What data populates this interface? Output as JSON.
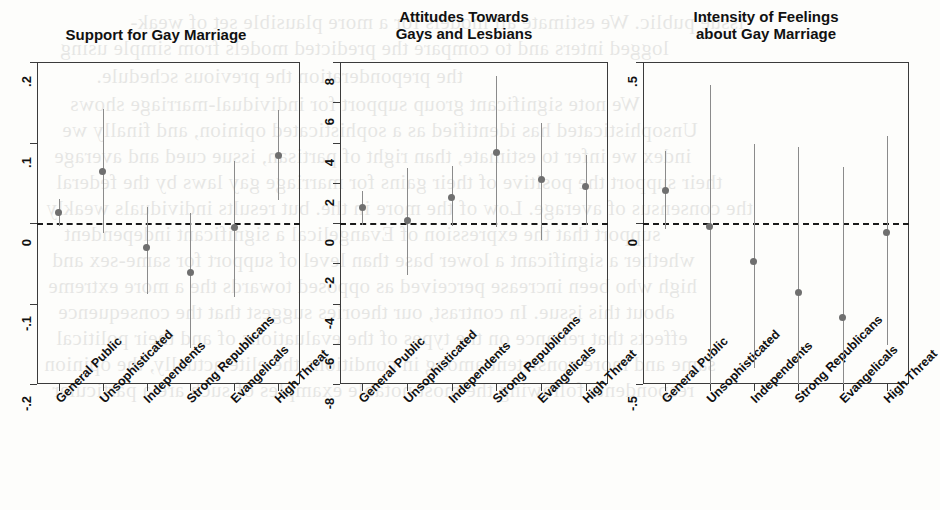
{
  "figure": {
    "background_color": "#fdfdfb",
    "point_color": "#6f6f6f",
    "interval_color": "#8b8b8b",
    "axis_color": "#3b3b3b",
    "zero_line_color": "#1a1a1a"
  },
  "bleed_text": [
    {
      "text": "issue public. We estimate all models for a more plausible set of weak-",
      "x": 130,
      "y": 10
    },
    {
      "text": "logged inters and to compare the predicted models from simple using",
      "x": 60,
      "y": 36
    },
    {
      "text": "the preponderation the previous schedule.",
      "x": 96,
      "y": 64
    },
    {
      "text": "We note significant group support for individual-marriage shows",
      "x": 70,
      "y": 92
    },
    {
      "text": "Unsophisticated has identified as a sophisticated opinion, and finally we",
      "x": 62,
      "y": 118
    },
    {
      "text": "index we infer to estimate, than right of partisan, issue cued and average",
      "x": 54,
      "y": 144
    },
    {
      "text": "their support the positive of their gains for marriage gay laws by the federal",
      "x": 56,
      "y": 170
    },
    {
      "text": "the consensus of average. Low of the more in the. but results individuals weakly",
      "x": 46,
      "y": 196
    },
    {
      "text": "support that the expression of Evangelical a significant independent",
      "x": 64,
      "y": 222
    },
    {
      "text": "whether a significant a lower base than level of support for same-sex and",
      "x": 52,
      "y": 248
    },
    {
      "text": "high who been increase perceived as opposed towards the a more extreme",
      "x": 48,
      "y": 274
    },
    {
      "text": "about this issue. In contrast, our theories suggest that the consequence",
      "x": 58,
      "y": 300
    },
    {
      "text": "effects that reliance on the types of the evaluations of and their political",
      "x": 56,
      "y": 326
    },
    {
      "text": "same and more consistent among in conditions the elite actually, the opinion",
      "x": 44,
      "y": 352
    },
    {
      "text": "respondents following the most notable examples of such are a particular",
      "x": 52,
      "y": 378
    }
  ],
  "panels": [
    {
      "id": "support-for-gay-marriage",
      "title": "Support for Gay Marriage",
      "title_lines": [
        "Support for Gay Marriage"
      ],
      "y_ticks": [
        ".2",
        ".1",
        "0",
        "-.1",
        "-.2"
      ],
      "y_tick_values": [
        0.2,
        0.1,
        0,
        -0.1,
        -0.2
      ],
      "ylim": [
        -0.2,
        0.2
      ],
      "zero_reference": 0
    },
    {
      "id": "attitudes-towards-gays-and-lesbians",
      "title": "Attitudes Towards Gays and Lesbians",
      "title_lines": [
        "Attitudes Towards",
        "Gays and Lesbians"
      ],
      "y_ticks": [
        "8",
        "6",
        "4",
        "2",
        "0",
        "-2",
        "-4",
        "-6",
        "-8"
      ],
      "y_tick_values": [
        8,
        6,
        4,
        2,
        0,
        -2,
        -4,
        -6,
        -8
      ],
      "ylim": [
        -8,
        8
      ],
      "zero_reference": 0
    },
    {
      "id": "intensity-of-feelings-about-gay-marriage",
      "title": "Intensity of Feelings about Gay Marriage",
      "title_lines": [
        "Intensity of Feelings",
        "about Gay Marriage"
      ],
      "y_ticks": [
        ".5",
        "0",
        "-.5"
      ],
      "y_tick_values": [
        0.5,
        0,
        -0.5
      ],
      "ylim": [
        -0.5,
        0.5
      ],
      "zero_reference": 0
    }
  ],
  "chart_data": [
    {
      "type": "scatter",
      "title": "Support for Gay Marriage",
      "xlabel": "",
      "ylabel": "",
      "ylim": [
        -0.2,
        0.2
      ],
      "yticks": [
        -0.2,
        -0.1,
        0,
        0.1,
        0.2
      ],
      "ytick_labels": [
        "-.2",
        "-.1",
        "0",
        ".1",
        ".2"
      ],
      "grid": false,
      "legend": "none",
      "zero_line": 0,
      "categories": [
        "General Public",
        "Unsophisticated",
        "Independents",
        "Strong Republicans",
        "Evangelicals",
        "High Threat"
      ],
      "values": [
        0.013,
        0.064,
        -0.03,
        -0.062,
        -0.005,
        0.084
      ],
      "ci_low": [
        -0.004,
        -0.012,
        -0.088,
        -0.155,
        -0.092,
        0.029
      ],
      "ci_high": [
        0.03,
        0.141,
        0.02,
        0.013,
        0.077,
        0.14
      ]
    },
    {
      "type": "scatter",
      "title": "Attitudes Towards Gays and Lesbians",
      "xlabel": "",
      "ylabel": "",
      "ylim": [
        -8,
        8
      ],
      "yticks": [
        -8,
        -6,
        -4,
        -2,
        0,
        2,
        4,
        6,
        8
      ],
      "ytick_labels": [
        "-8",
        "-6",
        "-4",
        "-2",
        "0",
        "2",
        "4",
        "6",
        "8"
      ],
      "grid": false,
      "legend": "none",
      "zero_line": 0,
      "categories": [
        "General Public",
        "Unsophisticated",
        "Independents",
        "Strong Republicans",
        "Evangelicals",
        "High Threat"
      ],
      "values": [
        0.75,
        0.1,
        1.25,
        3.5,
        2.15,
        1.8
      ],
      "ci_low": [
        -0.1,
        -2.6,
        -0.15,
        -0.2,
        -0.85,
        -0.1
      ],
      "ci_high": [
        1.6,
        2.75,
        2.85,
        7.3,
        4.95,
        3.4
      ]
    },
    {
      "type": "scatter",
      "title": "Intensity of Feelings about Gay Marriage",
      "xlabel": "",
      "ylabel": "",
      "ylim": [
        -0.5,
        0.5
      ],
      "yticks": [
        -0.5,
        0,
        0.5
      ],
      "ytick_labels": [
        "-.5",
        "0",
        ".5"
      ],
      "grid": false,
      "legend": "none",
      "zero_line": 0,
      "categories": [
        "General Public",
        "Unsophisticated",
        "Independents",
        "Strong Republicans",
        "Evangelicals",
        "High Threat"
      ],
      "values": [
        0.1,
        -0.01,
        -0.12,
        -0.215,
        -0.295,
        -0.03
      ],
      "ci_low": [
        -0.02,
        -0.5,
        -0.45,
        -0.5,
        -0.5,
        -0.38
      ],
      "ci_high": [
        0.225,
        0.43,
        0.245,
        0.235,
        0.175,
        0.27
      ]
    }
  ]
}
